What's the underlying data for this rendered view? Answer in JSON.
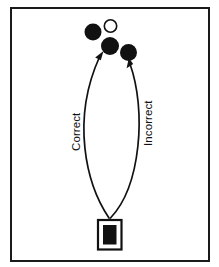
{
  "figure": {
    "background_color": "#ffffff",
    "ink_color": "#111111",
    "frame": {
      "name": "figure-border",
      "x": 10,
      "y": 7,
      "width": 200,
      "height": 255,
      "stroke_width": 2
    }
  },
  "labels": {
    "correct": "Correct",
    "incorrect": "Incorrect",
    "rotation_degrees": -90
  },
  "targets": [
    {
      "id": "disc-upper-left-filled",
      "fill": "filled",
      "color": "#111111",
      "cx": 93,
      "cy": 32,
      "r": 8.5
    },
    {
      "id": "disc-upper-right-open",
      "fill": "open",
      "color": "#ffffff",
      "cx": 110.5,
      "cy": 26,
      "r": 6.2
    },
    {
      "id": "disc-correct-target",
      "fill": "filled",
      "color": "#111111",
      "cx": 110,
      "cy": 46,
      "r": 9.0
    },
    {
      "id": "disc-incorrect-target",
      "fill": "filled",
      "color": "#111111",
      "cx": 128.5,
      "cy": 52.5,
      "r": 8.5
    }
  ],
  "start_object": {
    "id": "start-stimulus-box",
    "outer": {
      "x": 97,
      "y": 219,
      "width": 25,
      "height": 31
    },
    "inner": {
      "x": 102,
      "y": 224,
      "width": 15,
      "height": 21
    }
  },
  "trajectories": [
    {
      "id": "correct-trajectory",
      "label": "Correct",
      "from": "start-stimulus-box",
      "to": "disc-correct-target",
      "path": "M 109 219 C 86 185 72 120 100 58",
      "arrow_tip": {
        "x": 103,
        "y": 52
      }
    },
    {
      "id": "incorrect-trajectory",
      "label": "Incorrect",
      "from": "start-stimulus-box",
      "to": "disc-incorrect-target",
      "path": "M 110 219 C 140 186 146 110 130 65",
      "arrow_tip": {
        "x": 128,
        "y": 59
      }
    }
  ]
}
